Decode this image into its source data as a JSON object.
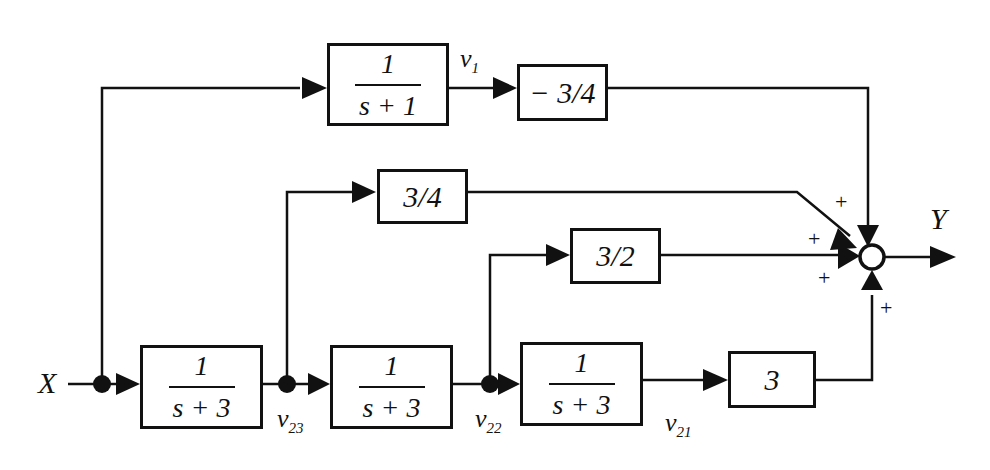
{
  "diagram": {
    "type": "block-diagram",
    "input_label": "X",
    "output_label": "Y",
    "blocks": [
      {
        "id": "top_tf",
        "num": "1",
        "den": "s + 1"
      },
      {
        "id": "top_gain",
        "value": "− 3/4"
      },
      {
        "id": "mid_gain",
        "value": "3/4"
      },
      {
        "id": "low_gain",
        "value": "3/2"
      },
      {
        "id": "tf1",
        "num": "1",
        "den": "s + 3"
      },
      {
        "id": "tf2",
        "num": "1",
        "den": "s + 3"
      },
      {
        "id": "tf3",
        "num": "1",
        "den": "s + 3"
      },
      {
        "id": "out_gain",
        "value": "3"
      }
    ],
    "signals": {
      "v1": {
        "base": "v",
        "sub": "1"
      },
      "v23": {
        "base": "v",
        "sub": "23"
      },
      "v22": {
        "base": "v",
        "sub": "22"
      },
      "v21": {
        "base": "v",
        "sub": "21"
      }
    },
    "summing_junction": {
      "signs": [
        "+",
        "+",
        "+",
        "+"
      ]
    }
  }
}
